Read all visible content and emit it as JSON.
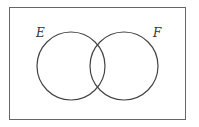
{
  "diagram": {
    "type": "venn",
    "sets": [
      {
        "name": "E"
      },
      {
        "name": "F"
      }
    ],
    "labels": {
      "left": "E",
      "right": "F"
    },
    "colors": {
      "stroke": "#444444",
      "frame": "#666666",
      "background": "#ffffff"
    }
  }
}
